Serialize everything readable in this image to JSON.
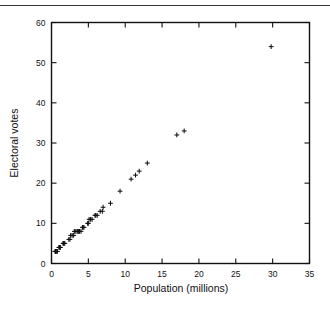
{
  "figure": {
    "background_color": "#ffffff",
    "ink_color": "#111111",
    "page_rule_visible": true
  },
  "chart_data": {
    "type": "scatter",
    "title": "",
    "xlabel": "Population (millions)",
    "ylabel": "Electoral votes",
    "xlim": [
      0,
      35
    ],
    "ylim": [
      0,
      60
    ],
    "xticks": [
      0,
      5,
      10,
      15,
      20,
      25,
      30,
      35
    ],
    "yticks": [
      0,
      10,
      20,
      30,
      40,
      50,
      60
    ],
    "xtick_labels": [
      "0",
      "5",
      "10",
      "15",
      "20",
      "25",
      "30",
      "35"
    ],
    "ytick_labels": [
      "0",
      "10",
      "20",
      "30",
      "40",
      "50",
      "60"
    ],
    "grid": false,
    "legend": null,
    "marker": "plus",
    "marker_color": "#111111",
    "series": [
      {
        "name": "States",
        "x": [
          0.47,
          0.55,
          0.58,
          0.6,
          0.72,
          0.8,
          1.0,
          1.1,
          1.16,
          1.2,
          1.58,
          1.6,
          1.7,
          1.8,
          2.35,
          2.5,
          2.6,
          2.8,
          3.0,
          3.1,
          3.3,
          3.5,
          3.6,
          3.7,
          3.8,
          4.0,
          4.2,
          4.3,
          4.4,
          4.9,
          5.0,
          5.1,
          5.3,
          5.5,
          5.9,
          6.0,
          6.2,
          6.6,
          6.9,
          7.0,
          8.0,
          9.3,
          10.8,
          11.4,
          11.9,
          13.0,
          17.0,
          18.0,
          29.8
        ],
        "y": [
          3,
          3,
          3,
          3,
          3,
          3,
          4,
          4,
          4,
          4,
          5,
          5,
          5,
          5,
          6,
          6,
          7,
          7,
          7,
          8,
          8,
          8,
          8,
          8,
          8,
          8,
          9,
          9,
          9,
          10,
          10,
          11,
          11,
          11,
          12,
          12,
          12,
          13,
          13,
          14,
          15,
          18,
          21,
          22,
          23,
          25,
          32,
          33,
          54
        ],
        "count": 49
      }
    ]
  }
}
